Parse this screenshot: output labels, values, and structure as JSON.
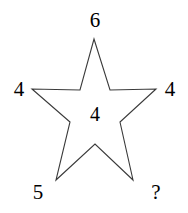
{
  "figure": {
    "type": "star-puzzle-diagram",
    "background_color": "#ffffff",
    "stroke_color": "#3a3a3a",
    "text_color": "#000000"
  },
  "star": {
    "name": "five-pointed-star-outline",
    "filled": false,
    "points": 5,
    "outline_path": "94,39 110,90 156,89 120,122 133,180 95,144 56,180 70,122 32,89 80,90",
    "vertices": {
      "top_point": [
        94,
        39
      ],
      "right_point": [
        156,
        89
      ],
      "bottom_right_point": [
        133,
        180
      ],
      "bottom_left_point": [
        56,
        180
      ],
      "left_point": [
        32,
        89
      ],
      "inner_top_right": [
        110,
        90
      ],
      "inner_right": [
        120,
        122
      ],
      "inner_bottom": [
        95,
        144
      ],
      "inner_left": [
        70,
        122
      ],
      "inner_top_left": [
        80,
        90
      ]
    }
  },
  "labels": [
    {
      "id": "top",
      "text": "6",
      "x": 95,
      "y": 20
    },
    {
      "id": "left",
      "text": "4",
      "x": 19,
      "y": 89
    },
    {
      "id": "right",
      "text": "4",
      "x": 170,
      "y": 89
    },
    {
      "id": "center",
      "text": "4",
      "x": 95,
      "y": 114
    },
    {
      "id": "bottom-left",
      "text": "5",
      "x": 38,
      "y": 192
    },
    {
      "id": "bottom-right",
      "text": "?",
      "x": 156,
      "y": 192
    }
  ]
}
